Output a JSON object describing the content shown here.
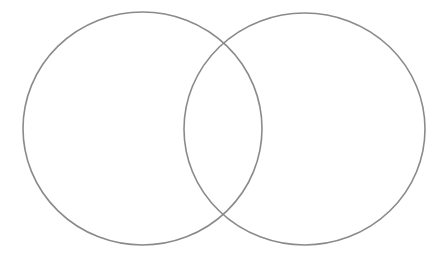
{
  "diagram": {
    "type": "venn",
    "canvas": {
      "width": 444,
      "height": 259,
      "background": "#ffffff"
    },
    "stroke_color": "#8a8a8a",
    "stroke_width": 1.6,
    "fill": "none",
    "sets": [
      {
        "id": "left",
        "label": "",
        "cx": 142.5,
        "cy": 128.5,
        "rx": 119.5,
        "ry": 116.5
      },
      {
        "id": "right",
        "label": "",
        "cx": 304.5,
        "cy": 129,
        "rx": 120.5,
        "ry": 116
      }
    ]
  }
}
